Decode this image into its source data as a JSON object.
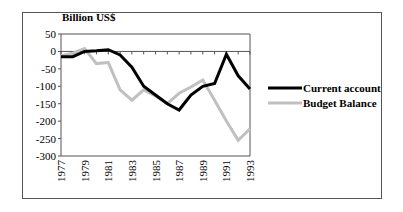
{
  "chart_data": {
    "type": "line",
    "title": "Billion US$",
    "xlabel": "",
    "ylabel": "Billion US$",
    "ylim": [
      -300,
      50
    ],
    "yticks": [
      50,
      0,
      -50,
      -100,
      -150,
      -200,
      -250,
      -300
    ],
    "x": [
      1977,
      1978,
      1979,
      1980,
      1981,
      1982,
      1983,
      1984,
      1985,
      1986,
      1987,
      1988,
      1989,
      1990,
      1991,
      1992,
      1993
    ],
    "xtick_labels": [
      "1977",
      "1979",
      "1981",
      "1983",
      "1985",
      "1987",
      "1989",
      "1991",
      "1993"
    ],
    "grid": false,
    "legend_position": "right",
    "series": [
      {
        "name": "Current account",
        "color": "#000000",
        "values": [
          -15,
          -15,
          0,
          2,
          5,
          -10,
          -45,
          -100,
          -125,
          -150,
          -168,
          -125,
          -100,
          -92,
          -8,
          -70,
          -108
        ]
      },
      {
        "name": "Budget Balance",
        "color": "#c0c0c0",
        "values": [
          -12,
          -5,
          8,
          -35,
          -32,
          -110,
          -140,
          -110,
          -128,
          -150,
          -120,
          -102,
          -82,
          -140,
          -200,
          -255,
          -222
        ]
      }
    ]
  }
}
